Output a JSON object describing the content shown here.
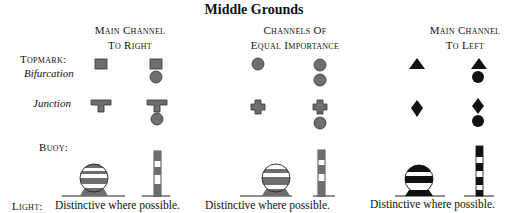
{
  "title": "Middle Grounds",
  "columns": [
    {
      "line1": "Main Channel",
      "line2": "To Right",
      "style": "gray",
      "color": "#6e6e6e"
    },
    {
      "line1": "Channels Of",
      "line2": "Equal Importance",
      "style": "gray",
      "color": "#6e6e6e"
    },
    {
      "line1": "Main Channel",
      "line2": "To Left",
      "style": "black",
      "color": "#111111"
    }
  ],
  "rows": {
    "topmark_label": "Topmark:",
    "bifurcation_label": "Bifurcation",
    "junction_label": "Junction",
    "buoy_label": "Buoy:",
    "light_label": "Light:"
  },
  "topmarks": {
    "right": {
      "bifurcation": "square",
      "junction": "t-shape"
    },
    "equal": {
      "bifurcation": "circle",
      "junction": "cross"
    },
    "left": {
      "bifurcation": "triangle",
      "junction": "diamond"
    }
  },
  "light_text": [
    "Distinctive where possible.",
    "Distinctive where possible.",
    "Distinctive where possible."
  ],
  "colors": {
    "gray_fill": "#6e6e6e",
    "black_fill": "#111111",
    "outline": "#222222"
  }
}
